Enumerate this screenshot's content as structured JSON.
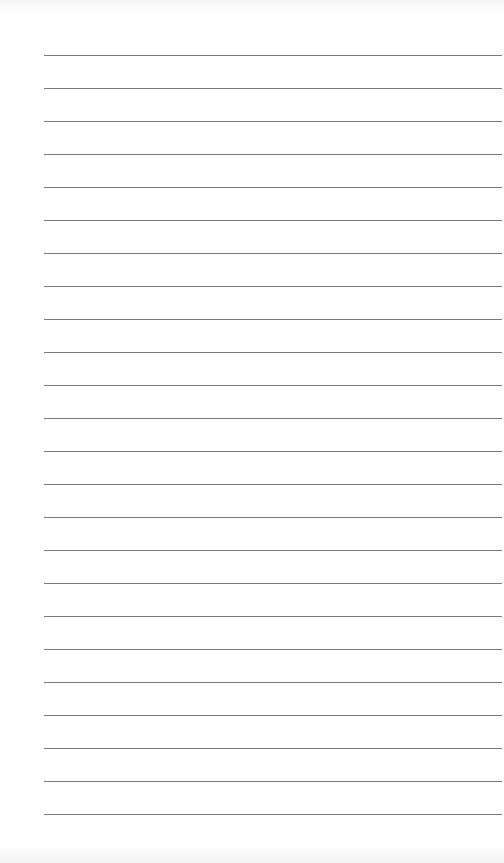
{
  "page": {
    "type": "lined-paper",
    "background_color": "#ffffff",
    "line_color": "#7a7a7a",
    "line_count": 24,
    "first_line_y": 55,
    "line_spacing": 33,
    "line_left": 44,
    "line_right_margin": 2
  }
}
